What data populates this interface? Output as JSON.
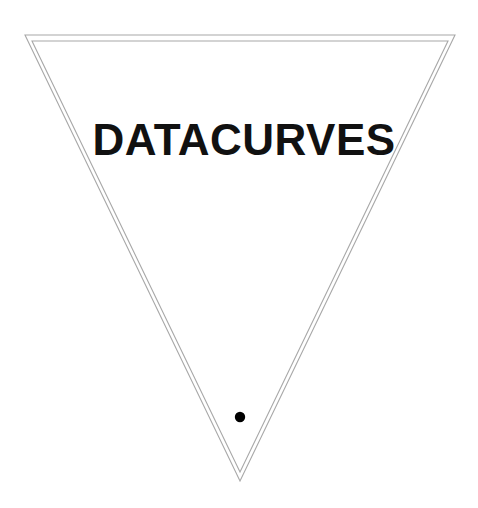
{
  "canvas": {
    "width": 478,
    "height": 508,
    "background_color": "#ffffff"
  },
  "emblem": {
    "wordmark": "DATACURVES",
    "wordmark_color": "#111111",
    "outline_color": "#a8a8a8",
    "outline_width": 1.1,
    "dot_color": "#000000",
    "outer_triangle": {
      "shape": "inverted-triangle",
      "points": "25,35 455,35 240,481"
    },
    "inner_triangle": {
      "shape": "inverted-triangle",
      "points": "32,41 448,41 240,472"
    },
    "wordmark_position": {
      "center_x": 244,
      "baseline_y": 155
    },
    "dot": {
      "center_x": 240,
      "center_y": 417,
      "radius": 5.2
    }
  }
}
